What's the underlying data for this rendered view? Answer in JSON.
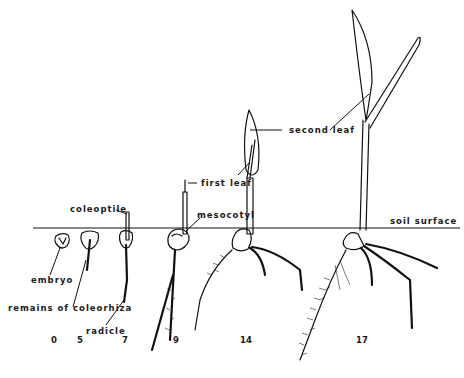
{
  "figure": {
    "type": "seedling development diagram",
    "reference_line": "soil surface",
    "labels": {
      "coleoptile": "coleoptile",
      "embryo": "embryo",
      "remains_of_coleorhiza": "remains of coleorhiza",
      "radicle": "radicle",
      "first_leaf": "first leaf",
      "mesocotyl": "mesocotyl",
      "second_leaf": "second leaf",
      "soil_surface": "soil surface"
    },
    "stages": [
      {
        "day": "0"
      },
      {
        "day": "5"
      },
      {
        "day": "7"
      },
      {
        "day": "9"
      },
      {
        "day": "14"
      },
      {
        "day": "17"
      }
    ],
    "colors": {
      "ink": "#111111",
      "background": "#ffffff"
    }
  }
}
